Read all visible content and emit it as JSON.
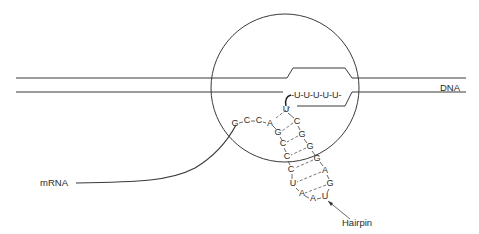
{
  "labels": {
    "dna": "DNA",
    "mrna": "mRNA",
    "hairpin": "Hairpin",
    "u_tail": "-U-U-U-U-U-"
  },
  "rna_sequence": {
    "leader": [
      "G",
      "C",
      "C",
      "A"
    ],
    "stem_left": [
      "U",
      "G",
      "C",
      "C",
      "C",
      "U"
    ],
    "stem_right": [
      "C",
      "G",
      "G",
      "G"
    ],
    "loop": [
      "A",
      "A",
      "U",
      "G",
      "A"
    ]
  },
  "diagram": {
    "title_elements": [
      "RNA polymerase transcription bubble",
      "DNA duplex",
      "mRNA transcript",
      "terminator hairpin",
      "poly-U tail"
    ]
  }
}
